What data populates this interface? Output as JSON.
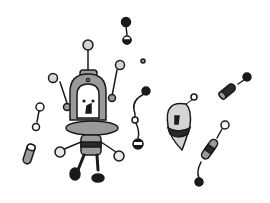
{
  "illustration": {
    "description": "Cartoon robot with antennae floating among small capsule-shaped creatures",
    "colors": {
      "background": "#ffffff",
      "outline": "#1a1a1a",
      "light_gray": "#d4d4d4",
      "mid_gray": "#9a9a9a",
      "dark": "#2a2a2a"
    }
  }
}
